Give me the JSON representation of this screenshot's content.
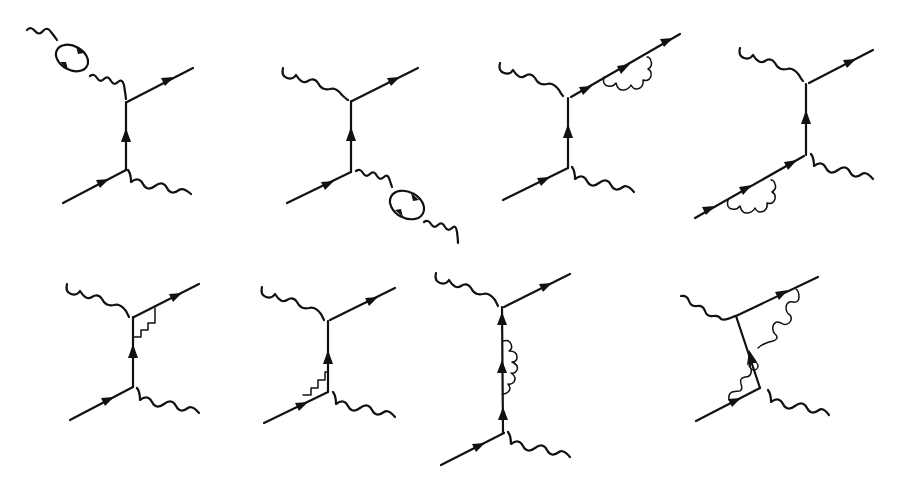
{
  "figure": {
    "layout": {
      "rows": 2,
      "columns": 4
    },
    "colors": {
      "ink": "#111111",
      "background": "#ffffff"
    },
    "diagrams": [
      {
        "id": 1,
        "row": 1,
        "col": 1,
        "label": "vacuum polarization on incoming photon"
      },
      {
        "id": 2,
        "row": 1,
        "col": 2,
        "label": "vacuum polarization on outgoing photon"
      },
      {
        "id": 3,
        "row": 1,
        "col": 3,
        "label": "self-energy on outgoing electron"
      },
      {
        "id": 4,
        "row": 1,
        "col": 4,
        "label": "self-energy on incoming electron"
      },
      {
        "id": 5,
        "row": 2,
        "col": 1,
        "label": "vertex correction at upper vertex"
      },
      {
        "id": 6,
        "row": 2,
        "col": 2,
        "label": "vertex correction at lower vertex"
      },
      {
        "id": 7,
        "row": 2,
        "col": 3,
        "label": "self-energy on internal propagator"
      },
      {
        "id": 8,
        "row": 2,
        "col": 4,
        "label": "box diagram"
      }
    ]
  }
}
